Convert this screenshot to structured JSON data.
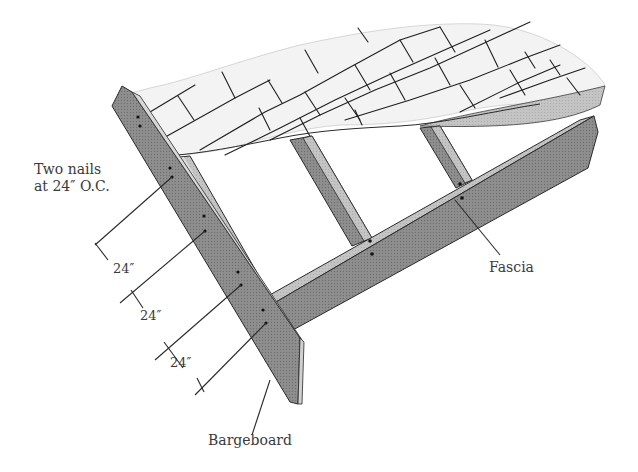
{
  "diagram": {
    "labels": {
      "nails_line1": "Two nails",
      "nails_line2": "at 24″ O.C.",
      "spacing_1": "24″",
      "spacing_2": "24″",
      "spacing_3": "24″",
      "bargeboard": "Bargeboard",
      "fascia": "Fascia"
    },
    "colors": {
      "background": "#ffffff",
      "lumber_dark": "#8a8a8a",
      "lumber_light": "#c8c8c8",
      "shingles": "#f2f2f2",
      "linework": "#2a2a2a",
      "text": "#3a3a3a"
    },
    "components": [
      "shingles",
      "rafters",
      "bargeboard",
      "fascia",
      "nails",
      "dimension-lines"
    ]
  }
}
